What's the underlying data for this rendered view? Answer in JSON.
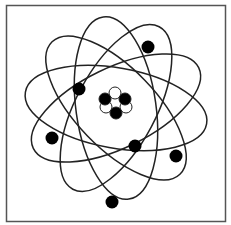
{
  "diagram": {
    "orbit_count": 5,
    "electron_count": 6,
    "nucleus": {
      "particles": [
        {
          "type": "neutron",
          "fill": "#ffffff"
        },
        {
          "type": "proton",
          "fill": "#000000"
        },
        {
          "type": "proton",
          "fill": "#000000"
        },
        {
          "type": "neutron",
          "fill": "#ffffff"
        },
        {
          "type": "neutron",
          "fill": "#ffffff"
        },
        {
          "type": "proton",
          "fill": "#000000"
        }
      ]
    },
    "colors": {
      "stroke": "#222222",
      "electron": "#000000",
      "background": "#ffffff",
      "frame": "#555555"
    }
  }
}
